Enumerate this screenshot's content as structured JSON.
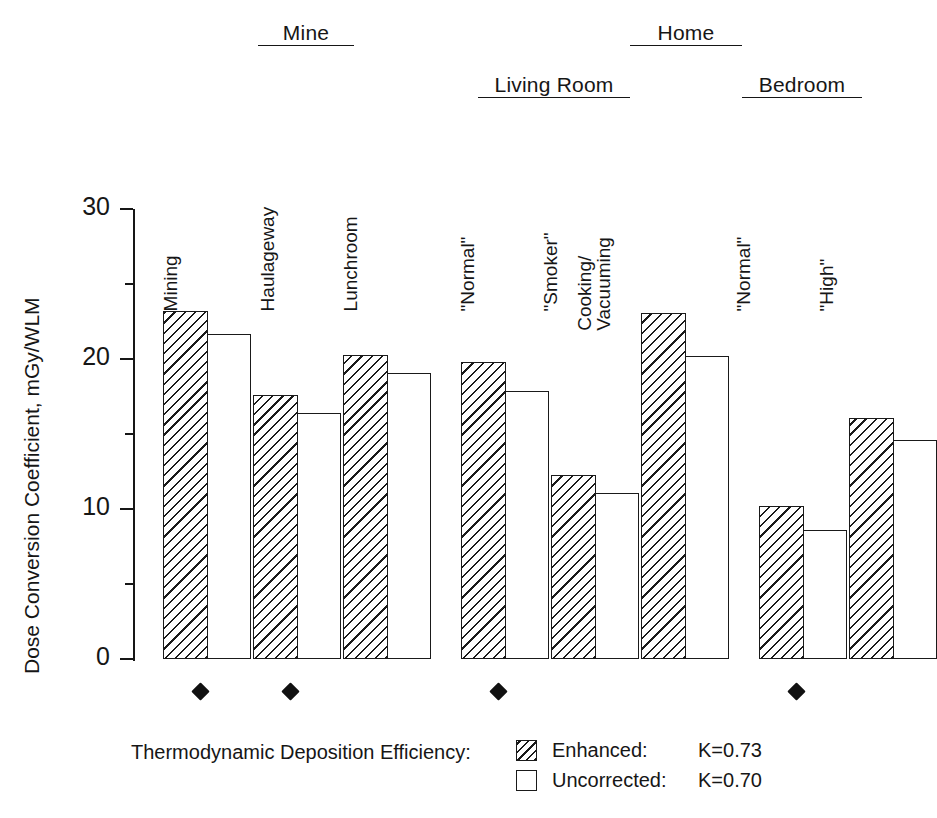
{
  "chart_data": {
    "type": "bar",
    "title": "",
    "xlabel": "",
    "ylabel": "Dose Conversion Coefficient, mGy/WLM",
    "ylim": [
      0,
      30
    ],
    "yticks": [
      "0",
      "10",
      "20",
      "30"
    ],
    "ytick_values": [
      0,
      10,
      20,
      30
    ],
    "yminor_ticks": [
      5,
      15,
      25
    ],
    "grid": false,
    "legend_position": "bottom-right",
    "legend_title": "Thermodynamic Deposition Efficiency:",
    "categories": [
      "Mining",
      "Haulageway",
      "Lunchroom",
      "\"Normal\"",
      "\"Smoker\"",
      "Cooking/\nVacuuming",
      "\"Normal\"",
      "\"High\""
    ],
    "series": [
      {
        "name": "Enhanced",
        "k": "K=0.73",
        "fill": "hatched",
        "values": [
          23.2,
          17.6,
          20.3,
          19.8,
          12.3,
          23.1,
          10.2,
          16.1
        ]
      },
      {
        "name": "Uncorrected",
        "k": "K=0.70",
        "fill": "white",
        "values": [
          21.7,
          16.4,
          19.1,
          17.9,
          11.1,
          20.2,
          8.6,
          14.6
        ]
      }
    ],
    "group_headers": [
      {
        "label": "Mine",
        "covers": [
          0,
          1,
          2
        ]
      },
      {
        "label": "Home",
        "covers": [
          3,
          4,
          5,
          6,
          7
        ]
      }
    ],
    "sub_headers": [
      {
        "label": "Living Room",
        "covers": [
          3,
          4,
          5
        ]
      },
      {
        "label": "Bedroom",
        "covers": [
          6,
          7
        ]
      }
    ],
    "annotations": {
      "marker_symbol": "diamond",
      "marker_categories": [
        0,
        1,
        3,
        6
      ]
    },
    "colors": {
      "ink": "#1a1a1a",
      "background": "#ffffff",
      "marker": "#111111"
    }
  },
  "axis": {
    "y_title": "Dose Conversion Coefficient, mGy/WLM",
    "tick_labels": {
      "t0": "0",
      "t10": "10",
      "t20": "20",
      "t30": "30"
    }
  },
  "headers": {
    "mine": "Mine",
    "home": "Home",
    "living_room": "Living Room",
    "bedroom": "Bedroom"
  },
  "category_labels": {
    "mining": "Mining",
    "haulageway": "Haulageway",
    "lunchroom": "Lunchroom",
    "lr_normal": "\"Normal\"",
    "lr_smoker": "\"Smoker\"",
    "cooking_line1": "Cooking/",
    "cooking_line2": "Vacuuming",
    "bd_normal": "\"Normal\"",
    "bd_high": "\"High\""
  },
  "legend": {
    "title": "Thermodynamic Deposition Efficiency:",
    "rows": [
      {
        "label": "Enhanced:",
        "k": "K=0.73"
      },
      {
        "label": "Uncorrected:",
        "k": "K=0.70"
      }
    ]
  }
}
